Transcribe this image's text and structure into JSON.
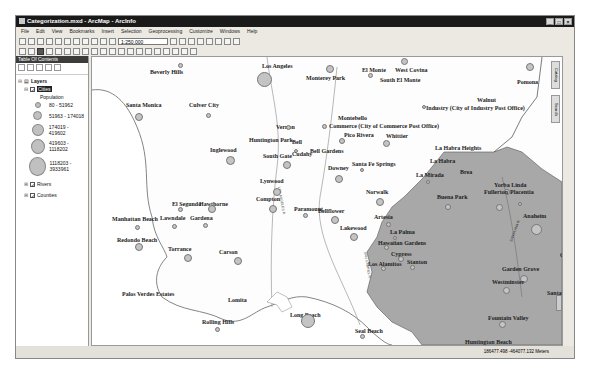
{
  "window": {
    "title": "Categorization.mxd - ArcMap - ArcInfo",
    "controls": [
      "_",
      "□",
      "×"
    ]
  },
  "menu": [
    "File",
    "Edit",
    "View",
    "Bookmarks",
    "Insert",
    "Selection",
    "Geoprocessing",
    "Customize",
    "Windows",
    "Help"
  ],
  "toolbar": {
    "scale": "1:250,000"
  },
  "toc": {
    "title": "Table Of Contents",
    "root": "Layers",
    "layers": [
      {
        "name": "Cities",
        "checked": true,
        "selected": true
      },
      {
        "name": "Rivers",
        "checked": true
      },
      {
        "name": "Counties",
        "checked": true
      }
    ],
    "legend_field": "Population",
    "legend": [
      {
        "label": "80 - 51962",
        "size": 6
      },
      {
        "label": "51963 - 174018",
        "size": 9
      },
      {
        "label": "174019 - 419602",
        "size": 12
      },
      {
        "label": "419603 - 1118202",
        "size": 15
      },
      {
        "label": "1118203 - 3933961",
        "size": 19
      }
    ]
  },
  "side_tabs": [
    "Catalog",
    "Search"
  ],
  "map": {
    "fill_colors": {
      "land": "#ffffff",
      "orange_county": "#a8a8a8"
    },
    "cities": [
      {
        "name": "Los Angeles",
        "x": 170,
        "y": 6,
        "dx": 172,
        "dy": 22,
        "r": 15
      },
      {
        "name": "Beverly Hills",
        "x": 58,
        "y": 12,
        "dx": 88,
        "dy": 8,
        "r": 5
      },
      {
        "name": "Monterey Park",
        "x": 214,
        "y": 18,
        "dx": 238,
        "dy": 12,
        "r": 8
      },
      {
        "name": "El Monte",
        "x": 270,
        "y": 10,
        "dx": 278,
        "dy": 18,
        "r": 5
      },
      {
        "name": "West Covina",
        "x": 303,
        "y": 10,
        "dx": 312,
        "dy": 4,
        "r": 7
      },
      {
        "name": "South El Monte",
        "x": 288,
        "y": 20,
        "dx": 0,
        "dy": 0,
        "r": 0
      },
      {
        "name": "Pomona",
        "x": 425,
        "y": 22,
        "dx": 438,
        "dy": 10,
        "r": 8
      },
      {
        "name": "Walnut",
        "x": 385,
        "y": 40,
        "dx": 0,
        "dy": 0,
        "r": 0
      },
      {
        "name": "Industry (City of Industry Post Office)",
        "x": 334,
        "y": 48,
        "dx": 332,
        "dy": 50,
        "r": 4
      },
      {
        "name": "Santa Monica",
        "x": 34,
        "y": 45,
        "dx": 47,
        "dy": 60,
        "r": 8
      },
      {
        "name": "Culver City",
        "x": 97,
        "y": 45,
        "dx": 116,
        "dy": 58,
        "r": 5
      },
      {
        "name": "Vernon",
        "x": 184,
        "y": 67,
        "dx": 196,
        "dy": 70,
        "r": 5
      },
      {
        "name": "Montebello",
        "x": 246,
        "y": 58,
        "dx": 0,
        "dy": 0,
        "r": 0
      },
      {
        "name": "Commerce (City of Commerce Post Office)",
        "x": 237,
        "y": 66,
        "dx": 232,
        "dy": 69,
        "r": 5
      },
      {
        "name": "Pico Rivera",
        "x": 252,
        "y": 75,
        "dx": 250,
        "dy": 84,
        "r": 6
      },
      {
        "name": "Whittier",
        "x": 294,
        "y": 76,
        "dx": 294,
        "dy": 86,
        "r": 7
      },
      {
        "name": "Huntington Park",
        "x": 157,
        "y": 80,
        "dx": 0,
        "dy": 0,
        "r": 0
      },
      {
        "name": "Bell",
        "x": 200,
        "y": 82,
        "dx": 204,
        "dy": 94,
        "r": 4
      },
      {
        "name": "Inglewood",
        "x": 118,
        "y": 90,
        "dx": 138,
        "dy": 103,
        "r": 9
      },
      {
        "name": "La Habra Heights",
        "x": 343,
        "y": 88,
        "dx": 0,
        "dy": 0,
        "r": 0
      },
      {
        "name": "South Gate",
        "x": 171,
        "y": 96,
        "dx": 195,
        "dy": 108,
        "r": 8
      },
      {
        "name": "Cudahy",
        "x": 200,
        "y": 94,
        "dx": 0,
        "dy": 0,
        "r": 0
      },
      {
        "name": "Bell Gardens",
        "x": 218,
        "y": 91,
        "dx": 0,
        "dy": 0,
        "r": 0
      },
      {
        "name": "Santa Fe Springs",
        "x": 260,
        "y": 104,
        "dx": 270,
        "dy": 113,
        "r": 4
      },
      {
        "name": "Downey",
        "x": 236,
        "y": 108,
        "dx": 247,
        "dy": 122,
        "r": 8
      },
      {
        "name": "Lynwood",
        "x": 168,
        "y": 121,
        "dx": 185,
        "dy": 135,
        "r": 8
      },
      {
        "name": "La Mirada",
        "x": 324,
        "y": 115,
        "dx": 336,
        "dy": 125,
        "r": 4
      },
      {
        "name": "La Habra",
        "x": 338,
        "y": 101,
        "dx": 0,
        "dy": 0,
        "r": 0
      },
      {
        "name": "Brea",
        "x": 368,
        "y": 112,
        "dx": 0,
        "dy": 0,
        "r": 0
      },
      {
        "name": "Yorba Linda",
        "x": 402,
        "y": 125,
        "dx": 415,
        "dy": 135,
        "r": 6
      },
      {
        "name": "Norwalk",
        "x": 274,
        "y": 132,
        "dx": 288,
        "dy": 145,
        "r": 8
      },
      {
        "name": "El Segundo",
        "x": 80,
        "y": 144,
        "dx": 88,
        "dy": 152,
        "r": 5
      },
      {
        "name": "Hawthorne",
        "x": 107,
        "y": 144,
        "dx": 120,
        "dy": 152,
        "r": 8
      },
      {
        "name": "Compton",
        "x": 164,
        "y": 139,
        "dx": 181,
        "dy": 152,
        "r": 8
      },
      {
        "name": "Paramount",
        "x": 202,
        "y": 149,
        "dx": 213,
        "dy": 158,
        "r": 5
      },
      {
        "name": "Bellflower",
        "x": 226,
        "y": 151,
        "dx": 243,
        "dy": 163,
        "r": 8
      },
      {
        "name": "Buena Park",
        "x": 345,
        "y": 137,
        "dx": 356,
        "dy": 150,
        "r": 6
      },
      {
        "name": "Fullerton",
        "x": 392,
        "y": 132,
        "dx": 407,
        "dy": 150,
        "r": 7
      },
      {
        "name": "Placentia",
        "x": 418,
        "y": 132,
        "dx": 428,
        "dy": 147,
        "r": 4
      },
      {
        "name": "Manhattan Beach",
        "x": 20,
        "y": 159,
        "dx": 45,
        "dy": 170,
        "r": 5
      },
      {
        "name": "Lawndale",
        "x": 68,
        "y": 158,
        "dx": 82,
        "dy": 169,
        "r": 5
      },
      {
        "name": "Gardena",
        "x": 98,
        "y": 158,
        "dx": 113,
        "dy": 168,
        "r": 5
      },
      {
        "name": "Artesia",
        "x": 282,
        "y": 157,
        "dx": 296,
        "dy": 167,
        "r": 5
      },
      {
        "name": "Anaheim",
        "x": 431,
        "y": 156,
        "dx": 444,
        "dy": 172,
        "r": 11
      },
      {
        "name": "Lakewood",
        "x": 248,
        "y": 168,
        "dx": 262,
        "dy": 180,
        "r": 8
      },
      {
        "name": "La Palma",
        "x": 298,
        "y": 172,
        "dx": 303,
        "dy": 181,
        "r": 4
      },
      {
        "name": "Villa Park",
        "x": 470,
        "y": 177,
        "dx": 482,
        "dy": 193,
        "r": 5
      },
      {
        "name": "Redondo Beach",
        "x": 25,
        "y": 180,
        "dx": 47,
        "dy": 190,
        "r": 8
      },
      {
        "name": "Hawaiian Gardens",
        "x": 286,
        "y": 183,
        "dx": 294,
        "dy": 190,
        "r": 5
      },
      {
        "name": "Torrance",
        "x": 76,
        "y": 189,
        "dx": 96,
        "dy": 201,
        "r": 8
      },
      {
        "name": "Carson",
        "x": 127,
        "y": 192,
        "dx": 146,
        "dy": 204,
        "r": 8
      },
      {
        "name": "Cypress",
        "x": 299,
        "y": 194,
        "dx": 309,
        "dy": 202,
        "r": 6
      },
      {
        "name": "Stanton",
        "x": 315,
        "y": 202,
        "dx": 320,
        "dy": 210,
        "r": 5
      },
      {
        "name": "Los Alamitos",
        "x": 276,
        "y": 204,
        "dx": 291,
        "dy": 211,
        "r": 5
      },
      {
        "name": "Orange",
        "x": 468,
        "y": 195,
        "dx": 478,
        "dy": 207,
        "r": 8
      },
      {
        "name": "Garden Grove",
        "x": 410,
        "y": 209,
        "dx": 432,
        "dy": 222,
        "r": 8
      },
      {
        "name": "Westminster",
        "x": 400,
        "y": 222,
        "dx": 414,
        "dy": 233,
        "r": 7
      },
      {
        "name": "Palos Verdes Estates",
        "x": 30,
        "y": 234,
        "dx": 0,
        "dy": 0,
        "r": 0
      },
      {
        "name": "Lomita",
        "x": 136,
        "y": 240,
        "dx": 0,
        "dy": 0,
        "r": 0
      },
      {
        "name": "Santa Ana",
        "x": 455,
        "y": 233,
        "dx": 470,
        "dy": 245,
        "r": 11
      },
      {
        "name": "Tustin",
        "x": 485,
        "y": 235,
        "dx": 494,
        "dy": 244,
        "r": 5
      },
      {
        "name": "Rolling Hills",
        "x": 110,
        "y": 262,
        "dx": 125,
        "dy": 272,
        "r": 5
      },
      {
        "name": "Long Beach",
        "x": 198,
        "y": 255,
        "dx": 216,
        "dy": 264,
        "r": 14
      },
      {
        "name": "Seal Beach",
        "x": 263,
        "y": 271,
        "dx": 270,
        "dy": 279,
        "r": 5
      },
      {
        "name": "Fountain Valley",
        "x": 396,
        "y": 258,
        "dx": 410,
        "dy": 267,
        "r": 7
      },
      {
        "name": "Huntington Beach",
        "x": 373,
        "y": 282,
        "dx": 395,
        "dy": 294,
        "r": 10
      },
      {
        "name": "Irvine",
        "x": 484,
        "y": 283,
        "dx": 491,
        "dy": 293,
        "r": 7
      },
      {
        "name": "Costa Mesa",
        "x": 428,
        "y": 295,
        "dx": 436,
        "dy": 305,
        "r": 6
      }
    ],
    "river_labels": [
      "LOS ANGELES R.",
      "SAN GABRIEL R.",
      "SANTA ANA R."
    ]
  },
  "status": {
    "coordinates": "186477.498 -464077.132 Meters"
  }
}
